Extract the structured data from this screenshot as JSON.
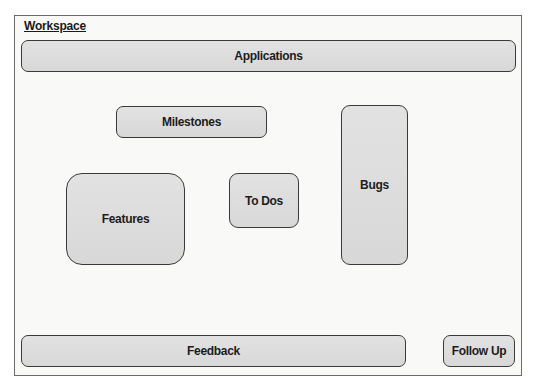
{
  "workspace": {
    "title": "Workspace",
    "areas": {
      "applications": "Applications",
      "milestones": "Milestones",
      "features": "Features",
      "todos": "To Dos",
      "bugs": "Bugs",
      "feedback": "Feedback",
      "follow_up": "Follow Up"
    }
  }
}
